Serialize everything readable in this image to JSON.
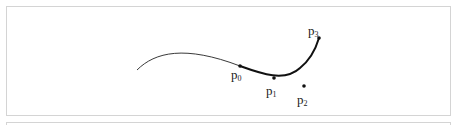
{
  "diagram": {
    "title": "",
    "curve": {
      "thin_path": "M137,70 C155,52 185,45 240,66",
      "thick_path": "M240,66 C262,74 285,82 300,68 C310,60 316,48 319,38"
    },
    "points": [
      {
        "id": "p0",
        "label": "p",
        "sub": "0",
        "x": 240,
        "y": 66,
        "label_x": 231,
        "label_y": 68
      },
      {
        "id": "p1",
        "label": "p",
        "sub": "1",
        "x": 274,
        "y": 78,
        "label_x": 266,
        "label_y": 84
      },
      {
        "id": "p2",
        "label": "p",
        "sub": "2",
        "x": 304,
        "y": 86,
        "label_x": 297,
        "label_y": 93
      },
      {
        "id": "p3",
        "label": "p",
        "sub": "3",
        "x": 319,
        "y": 38,
        "label_x": 308,
        "label_y": 24
      }
    ]
  }
}
